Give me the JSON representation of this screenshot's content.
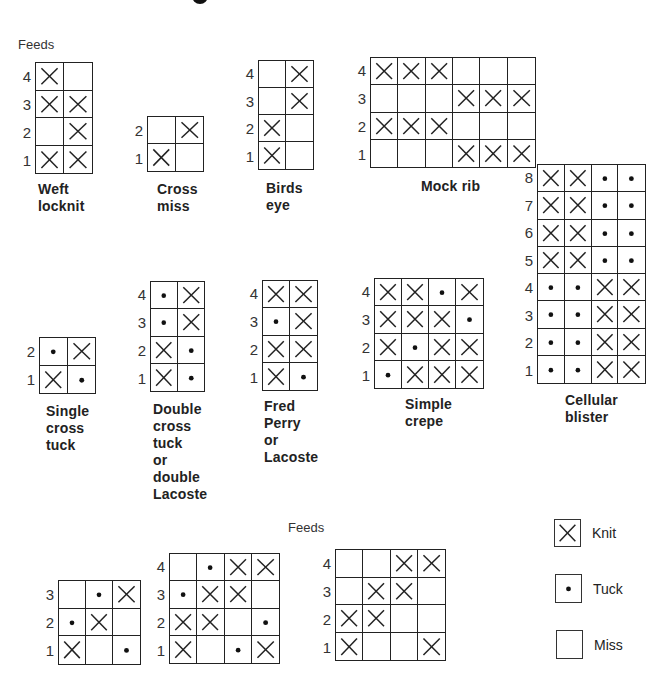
{
  "legend": {
    "items": [
      {
        "code": "K",
        "label": "Knit",
        "icon": "cross-icon"
      },
      {
        "code": "T",
        "label": "Tuck",
        "icon": "dot-icon"
      },
      {
        "code": "M",
        "label": "Miss",
        "icon": "empty-box-icon"
      }
    ]
  },
  "labels": {
    "feeds_top": "Feeds",
    "feeds_bottom": "Feeds"
  },
  "structures": [
    {
      "id": "weft-locknit",
      "caption": "Weft\nlocknit",
      "feeds": [
        "4",
        "3",
        "2",
        "1"
      ],
      "rows": [
        [
          "K",
          "M"
        ],
        [
          "K",
          "K"
        ],
        [
          "M",
          "K"
        ],
        [
          "K",
          "K"
        ]
      ],
      "box": [
        35,
        62,
        58,
        112
      ],
      "caption_pos": [
        38,
        181
      ]
    },
    {
      "id": "cross-miss",
      "caption": "Cross\nmiss",
      "feeds": [
        "2",
        "1"
      ],
      "rows": [
        [
          "M",
          "K"
        ],
        [
          "K",
          "M"
        ]
      ],
      "box": [
        147,
        116,
        57,
        56
      ],
      "caption_pos": [
        157,
        181
      ]
    },
    {
      "id": "birds-eye",
      "caption": "Birds\neye",
      "feeds": [
        "4",
        "3",
        "2",
        "1"
      ],
      "rows": [
        [
          "M",
          "K"
        ],
        [
          "M",
          "K"
        ],
        [
          "K",
          "M"
        ],
        [
          "K",
          "M"
        ]
      ],
      "box": [
        258,
        60,
        56,
        110
      ],
      "caption_pos": [
        266,
        180
      ]
    },
    {
      "id": "mock-rib",
      "caption": "Mock rib",
      "feeds": [
        "4",
        "3",
        "2",
        "1"
      ],
      "rows": [
        [
          "K",
          "K",
          "K",
          "M",
          "M",
          "M"
        ],
        [
          "M",
          "M",
          "M",
          "K",
          "K",
          "K"
        ],
        [
          "K",
          "K",
          "K",
          "M",
          "M",
          "M"
        ],
        [
          "M",
          "M",
          "M",
          "K",
          "K",
          "K"
        ]
      ],
      "box": [
        370,
        57,
        166,
        111
      ],
      "caption_pos": [
        421,
        178
      ]
    },
    {
      "id": "cellular-blister",
      "caption": "Cellular\nblister",
      "feeds": [
        "8",
        "7",
        "6",
        "5",
        "4",
        "3",
        "2",
        "1"
      ],
      "rows": [
        [
          "K",
          "K",
          "T",
          "T"
        ],
        [
          "K",
          "K",
          "T",
          "T"
        ],
        [
          "K",
          "K",
          "T",
          "T"
        ],
        [
          "K",
          "K",
          "T",
          "T"
        ],
        [
          "T",
          "T",
          "K",
          "K"
        ],
        [
          "T",
          "T",
          "K",
          "K"
        ],
        [
          "T",
          "T",
          "K",
          "K"
        ],
        [
          "T",
          "T",
          "K",
          "K"
        ]
      ],
      "box": [
        537,
        164,
        109,
        220
      ],
      "caption_pos": [
        565,
        392
      ]
    },
    {
      "id": "single-cross-tuck",
      "caption": "Single\ncross\ntuck",
      "feeds": [
        "2",
        "1"
      ],
      "rows": [
        [
          "T",
          "K"
        ],
        [
          "K",
          "T"
        ]
      ],
      "box": [
        39,
        337,
        57,
        57
      ],
      "caption_pos": [
        46,
        403
      ]
    },
    {
      "id": "double-cross-tuck",
      "caption": "Double\ncross\ntuck\nor\ndouble\nLacoste",
      "feeds": [
        "4",
        "3",
        "2",
        "1"
      ],
      "rows": [
        [
          "T",
          "K"
        ],
        [
          "T",
          "K"
        ],
        [
          "K",
          "T"
        ],
        [
          "K",
          "T"
        ]
      ],
      "box": [
        150,
        281,
        55,
        111
      ],
      "caption_pos": [
        153,
        401
      ]
    },
    {
      "id": "fred-perry",
      "caption": "Fred\nPerry\nor\nLacoste",
      "feeds": [
        "4",
        "3",
        "2",
        "1"
      ],
      "rows": [
        [
          "K",
          "K"
        ],
        [
          "T",
          "K"
        ],
        [
          "K",
          "K"
        ],
        [
          "K",
          "T"
        ]
      ],
      "box": [
        262,
        280,
        56,
        111
      ],
      "caption_pos": [
        264,
        398
      ]
    },
    {
      "id": "simple-crepe",
      "caption": "Simple\ncrepe",
      "feeds": [
        "4",
        "3",
        "2",
        "1"
      ],
      "rows": [
        [
          "K",
          "K",
          "T",
          "K"
        ],
        [
          "K",
          "K",
          "K",
          "T"
        ],
        [
          "K",
          "T",
          "K",
          "K"
        ],
        [
          "T",
          "K",
          "K",
          "K"
        ]
      ],
      "box": [
        374,
        278,
        110,
        111
      ],
      "caption_pos": [
        405,
        396
      ]
    },
    {
      "id": "bottom-3x3",
      "caption": "",
      "feeds": [
        "3",
        "2",
        "1"
      ],
      "rows": [
        [
          "M",
          "T",
          "K"
        ],
        [
          "T",
          "K",
          "M"
        ],
        [
          "K",
          "M",
          "T"
        ]
      ],
      "box": [
        58,
        580,
        83,
        85
      ],
      "caption_pos": [
        0,
        0
      ]
    },
    {
      "id": "bottom-4x4-tuck",
      "caption": "",
      "feeds": [
        "4",
        "3",
        "2",
        "1"
      ],
      "rows": [
        [
          "M",
          "T",
          "K",
          "K"
        ],
        [
          "T",
          "K",
          "K",
          "M"
        ],
        [
          "K",
          "K",
          "M",
          "T"
        ],
        [
          "K",
          "M",
          "T",
          "K"
        ]
      ],
      "box": [
        169,
        553,
        111,
        111
      ],
      "caption_pos": [
        0,
        0
      ]
    },
    {
      "id": "bottom-4x4-knit",
      "caption": "",
      "feeds": [
        "4",
        "3",
        "2",
        "1"
      ],
      "rows": [
        [
          "M",
          "M",
          "K",
          "K"
        ],
        [
          "M",
          "K",
          "K",
          "M"
        ],
        [
          "K",
          "K",
          "M",
          "M"
        ],
        [
          "K",
          "M",
          "M",
          "K"
        ]
      ],
      "box": [
        335,
        549,
        111,
        112
      ],
      "caption_pos": [
        0,
        0
      ]
    }
  ]
}
